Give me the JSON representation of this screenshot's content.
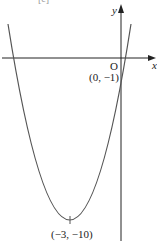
{
  "figure": {
    "part_label": "[c]",
    "x_axis_label": "x",
    "y_axis_label": "y",
    "origin_label": "O",
    "y_intercept_label": "(0, −1)",
    "vertex_label": "(−3, −10)",
    "curve": "parabola y = x² + 6x − 1 (opens upward)",
    "line_color": "#555555",
    "axis_color": "#222222"
  }
}
